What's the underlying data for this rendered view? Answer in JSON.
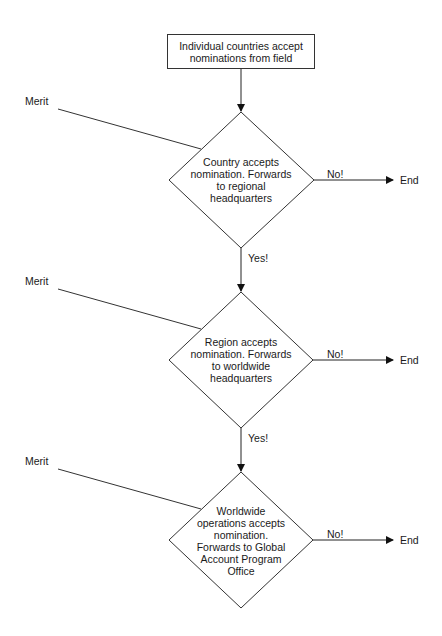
{
  "diagram": {
    "start": {
      "label": "Individual countries accept nominations from field"
    },
    "decisions": [
      {
        "label": "Country accepts nomination. Forwards to regional headquarters",
        "input": "Merit",
        "no_label": "No!",
        "no_target": "End",
        "yes_label": "Yes!"
      },
      {
        "label": "Region accepts nomination. Forwards to worldwide headquarters",
        "input": "Merit",
        "no_label": "No!",
        "no_target": "End",
        "yes_label": "Yes!"
      },
      {
        "label": "Worldwide operations accepts nomination. Forwards to Global Account Program Office",
        "input": "Merit",
        "no_label": "No!",
        "no_target": "End"
      }
    ]
  }
}
